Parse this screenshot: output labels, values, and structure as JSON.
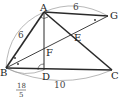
{
  "diagram": {
    "type": "geometry-figure",
    "points": {
      "A": {
        "label": "A",
        "x": 44,
        "y": 12
      },
      "G": {
        "label": "G",
        "x": 108,
        "y": 16
      },
      "B": {
        "label": "B",
        "x": 6,
        "y": 68
      },
      "D": {
        "label": "D",
        "x": 44,
        "y": 70
      },
      "C": {
        "label": "C",
        "x": 112,
        "y": 70
      },
      "F": {
        "label": "F",
        "x": 44,
        "y": 49
      },
      "E": {
        "label": "E",
        "x": 72,
        "y": 35
      }
    },
    "measurements": {
      "AG": "6",
      "AB": "6",
      "BC": "10",
      "BD_num": "18",
      "BD_den": "5"
    },
    "colors": {
      "stroke": "#2a2a2a",
      "arc": "#888888"
    }
  }
}
